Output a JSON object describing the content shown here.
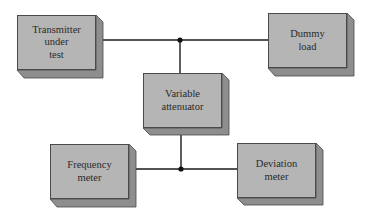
{
  "diagram": {
    "type": "block-diagram",
    "colors": {
      "face": "#b5b5b5",
      "side": "#8e8e8e",
      "outline": "#4a4a4a",
      "wire": "#1a1a1a"
    },
    "blocks": [
      {
        "id": "transmitter",
        "label": "Transmitter\nunder\ntest",
        "x": 17,
        "y": 15
      },
      {
        "id": "dummy_load",
        "label": "Dummy\nload",
        "x": 268,
        "y": 13
      },
      {
        "id": "attenuator",
        "label": "Variable\nattenuator",
        "x": 143,
        "y": 73
      },
      {
        "id": "frequency_meter",
        "label": "Frequency\nmeter",
        "x": 50,
        "y": 144
      },
      {
        "id": "deviation_meter",
        "label": "Deviation\nmeter",
        "x": 237,
        "y": 143
      }
    ],
    "junctions": [
      {
        "id": "top",
        "x": 180,
        "y": 40
      },
      {
        "id": "bottom",
        "x": 181,
        "y": 169
      }
    ],
    "connections": [
      {
        "from": "transmitter",
        "to": "top"
      },
      {
        "from": "top",
        "to": "dummy_load"
      },
      {
        "from": "top",
        "to": "attenuator"
      },
      {
        "from": "attenuator",
        "to": "bottom"
      },
      {
        "from": "frequency_meter",
        "to": "bottom"
      },
      {
        "from": "bottom",
        "to": "deviation_meter"
      }
    ]
  }
}
